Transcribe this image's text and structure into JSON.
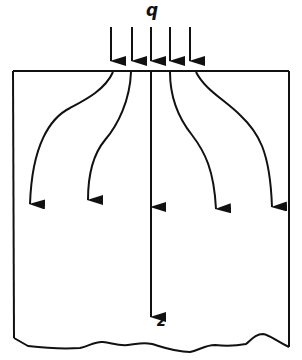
{
  "diagram": {
    "type": "stress-distribution",
    "labels": {
      "load": "q",
      "depth_axis": "z"
    },
    "colors": {
      "stroke": "#111111",
      "background": "#ffffff"
    },
    "load_arrows": {
      "count": 5,
      "x_positions": [
        111,
        132,
        151,
        170,
        190
      ]
    },
    "stress_paths": {
      "count": 5,
      "description": "Curved trajectories fanning out from the loaded area into the soil mass"
    },
    "soil_block": {
      "top_edge": "flat",
      "bottom_edge": "irregular (break line)"
    }
  }
}
